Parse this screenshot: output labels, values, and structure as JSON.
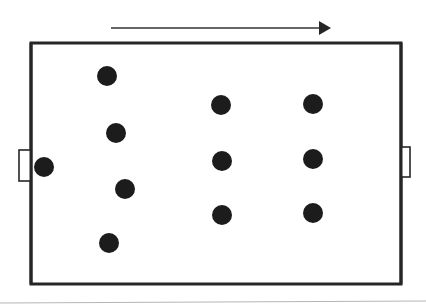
{
  "diagram": {
    "type": "field-formation",
    "canvas": {
      "width": 426,
      "height": 308,
      "background": "#ffffff"
    },
    "colors": {
      "stroke": "#262626",
      "player": "#1c1c1c",
      "arrow": "#333333",
      "baseline": "#b5b5b5"
    },
    "direction_arrow": {
      "x1": 111,
      "y1": 28,
      "x2": 331,
      "y2": 28,
      "label": "attack direction"
    },
    "field": {
      "x": 31,
      "y": 43,
      "width": 370,
      "height": 241,
      "stroke_width": 3
    },
    "goals": [
      {
        "side": "left",
        "x": 19,
        "y": 150,
        "width": 12,
        "height": 31
      },
      {
        "side": "right",
        "x": 401,
        "y": 147,
        "width": 9,
        "height": 30
      }
    ],
    "players": [
      {
        "role": "goalkeeper",
        "cx": 44,
        "cy": 167,
        "r": 10
      },
      {
        "role": "defender",
        "cx": 107,
        "cy": 76,
        "r": 10
      },
      {
        "role": "defender",
        "cx": 116,
        "cy": 133,
        "r": 10
      },
      {
        "role": "defender",
        "cx": 125,
        "cy": 189,
        "r": 10
      },
      {
        "role": "defender",
        "cx": 109,
        "cy": 243,
        "r": 10
      },
      {
        "role": "midfielder",
        "cx": 221,
        "cy": 105,
        "r": 10
      },
      {
        "role": "midfielder",
        "cx": 222,
        "cy": 161,
        "r": 10
      },
      {
        "role": "midfielder",
        "cx": 222,
        "cy": 215,
        "r": 10
      },
      {
        "role": "forward",
        "cx": 313,
        "cy": 104,
        "r": 10
      },
      {
        "role": "forward",
        "cx": 313,
        "cy": 159,
        "r": 10
      },
      {
        "role": "forward",
        "cx": 313,
        "cy": 213,
        "r": 10
      }
    ],
    "baseline": {
      "x1": 0,
      "y1": 303,
      "x2": 426,
      "y2": 301
    }
  }
}
